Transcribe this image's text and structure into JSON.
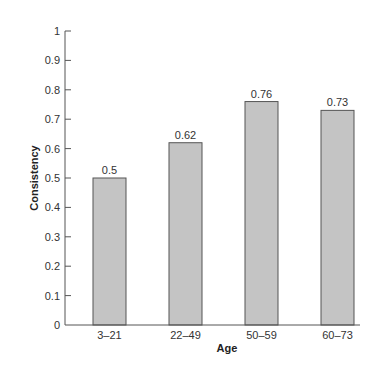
{
  "chart_data": {
    "type": "bar",
    "title": "",
    "xlabel": "Age",
    "ylabel": "Consistency",
    "categories": [
      "3–21",
      "22–49",
      "50–59",
      "60–73"
    ],
    "values": [
      0.5,
      0.62,
      0.76,
      0.73
    ],
    "data_labels": [
      "0.5",
      "0.62",
      "0.76",
      "0.73"
    ],
    "ylim": [
      0,
      1
    ],
    "yticks": [
      0,
      0.1,
      0.2,
      0.3,
      0.4,
      0.5,
      0.6,
      0.7,
      0.8,
      0.9,
      1
    ],
    "ytick_labels": [
      "0",
      "0.1",
      "0.2",
      "0.3",
      "0.4",
      "0.5",
      "0.6",
      "0.7",
      "0.8",
      "0.9",
      "1"
    ],
    "grid": false,
    "legend": "none",
    "colors": {
      "bar_fill": "#c4c4c4",
      "bar_stroke": "#555555",
      "axis": "#555555"
    }
  }
}
